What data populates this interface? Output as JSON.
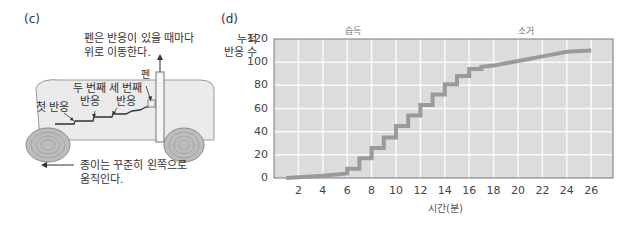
{
  "panel_c": {
    "label": "(c)",
    "pen_note_line1": "펜은 반응이 있을 때마다",
    "pen_note_line2": "위로 이동한다.",
    "pen_label": "펜",
    "second_response_line1": "두 번째",
    "second_response_line2": "반응",
    "third_response_line1": "세 번째",
    "third_response_line2": "반응",
    "first_response": "첫 반응",
    "paper_note_line1": "종이는 꾸준히 왼쪽으로",
    "paper_note_line2": "움직인다."
  },
  "panel_d": {
    "label": "(d)",
    "ylabel_line1": "누적",
    "ylabel_line2": "반응 수",
    "xlabel": "시간(분)",
    "section_left": "습득",
    "section_right": "소거"
  },
  "chart_data": {
    "type": "line",
    "title": "(d)",
    "xlabel": "시간(분)",
    "ylabel": "누적 반응 수",
    "xlim": [
      0,
      28
    ],
    "ylim": [
      0,
      120
    ],
    "x_ticks": [
      2,
      4,
      6,
      8,
      10,
      12,
      14,
      16,
      18,
      20,
      22,
      24,
      26
    ],
    "y_ticks": [
      0,
      20,
      40,
      60,
      80,
      100,
      120
    ],
    "grid": true,
    "annotations": [
      "습득",
      "소거"
    ],
    "series": [
      {
        "name": "누적 반응 수",
        "x": [
          1,
          4,
          6,
          6,
          7,
          7,
          8,
          8,
          9,
          9,
          10,
          10,
          11,
          11,
          12,
          12,
          13,
          13,
          14,
          14,
          15,
          15,
          16,
          16,
          17,
          17,
          18,
          19,
          20,
          21,
          22,
          23,
          24,
          26
        ],
        "y": [
          0,
          2,
          4,
          8,
          8,
          17,
          17,
          26,
          26,
          35,
          35,
          45,
          45,
          54,
          54,
          63,
          63,
          72,
          72,
          81,
          81,
          88,
          88,
          94,
          94,
          96,
          97,
          99,
          101,
          103,
          105,
          107,
          109,
          110
        ]
      }
    ]
  }
}
